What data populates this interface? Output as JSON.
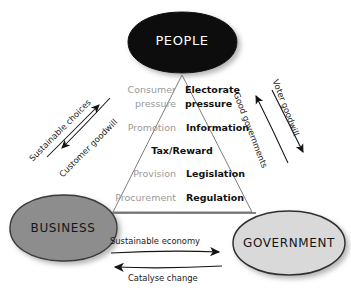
{
  "diagram": {
    "background_color": "#ffffff",
    "nodes": [
      {
        "id": "people",
        "label": "PEOPLE",
        "fill": "#0d0d0d",
        "text_color": "#ffffff",
        "cx": 182,
        "cy": 42,
        "rx": 54,
        "ry": 30,
        "font_size": 13
      },
      {
        "id": "business",
        "label": "BUSINESS",
        "fill": "#8d8d8d",
        "text_color": "#161616",
        "cx": 63,
        "cy": 228,
        "rx": 54,
        "ry": 33,
        "font_size": 12
      },
      {
        "id": "government",
        "label": "GOVERNMENT",
        "fill": "#d9d9d9",
        "text_color": "#161616",
        "cx": 289,
        "cy": 243,
        "rx": 56,
        "ry": 32,
        "font_size": 12
      }
    ],
    "triangle": {
      "apex": [
        182,
        75
      ],
      "left_base": [
        113,
        212
      ],
      "right_base": [
        252,
        212
      ],
      "stroke": "#6f6f6f",
      "stroke_width": 0.9
    },
    "matrix": {
      "left_column_color": "#9a9a9a",
      "right_column_color": "#111111",
      "rows": [
        {
          "left": "Consumer",
          "right": "Electorate"
        },
        {
          "left": "pressure",
          "right": "pressure"
        },
        {
          "left": "Promotion",
          "right": "Information"
        },
        {
          "left": "",
          "center": "Tax/Reward",
          "right": ""
        },
        {
          "left": "Provision",
          "right": "Legislation"
        },
        {
          "left": "Procurement",
          "right": "Regulation"
        }
      ]
    },
    "arrows": [
      {
        "id": "sustainable-choices",
        "label": "Sustainable choices",
        "direction": "business-to-people",
        "rotation": -45
      },
      {
        "id": "customer-goodwill",
        "label": "Customer goodwill",
        "direction": "people-to-business",
        "rotation": -45
      },
      {
        "id": "good-governments",
        "label": "Good governments",
        "direction": "government-to-people",
        "rotation": 69
      },
      {
        "id": "voter-goodwill",
        "label": "Voter goodwill",
        "direction": "people-to-government",
        "rotation": 69
      },
      {
        "id": "sustainable-economy",
        "label": "Sustainable economy",
        "direction": "business-to-government",
        "rotation": 0
      },
      {
        "id": "catalyse-change",
        "label": "Catalyse change",
        "direction": "government-to-business",
        "rotation": 0
      }
    ]
  }
}
